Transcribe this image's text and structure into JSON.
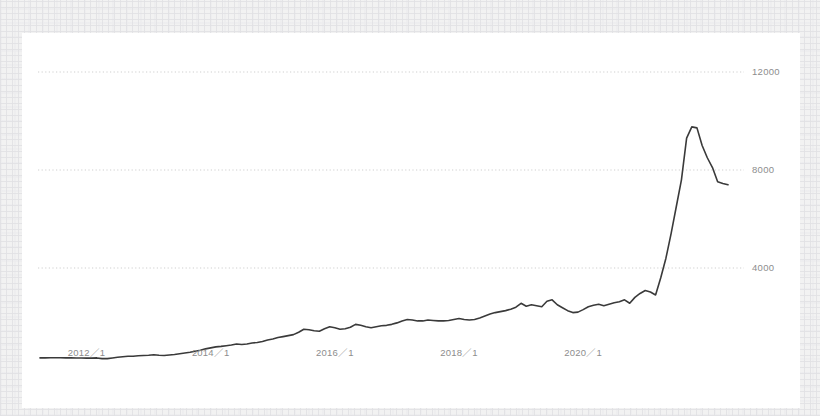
{
  "chart_data": {
    "type": "line",
    "title": "",
    "subtitle": "",
    "xlabel": "",
    "ylabel": "",
    "grid": true,
    "legend": null,
    "line_color": "#3a3a3a",
    "grid_color": "#c9c9c9",
    "tick_color": "#8d8d8d",
    "ylim": [
      0,
      13000
    ],
    "yticks": [
      4000,
      8000,
      12000
    ],
    "ytick_labels": [
      "4000",
      "8000",
      "12000"
    ],
    "xticks": [
      "2012/1",
      "2014/1",
      "2016/1",
      "2018/1",
      "2020/1"
    ],
    "xtick_labels": [
      "2012／1",
      "2014／1",
      "2016／1",
      "2018／1",
      "2020／1"
    ],
    "xlim": [
      "2011/4",
      "2021/8"
    ],
    "x": [
      "2011/4",
      "2011/5",
      "2011/6",
      "2011/7",
      "2011/8",
      "2011/9",
      "2011/10",
      "2011/11",
      "2011/12",
      "2012/1",
      "2012/2",
      "2012/3",
      "2012/4",
      "2012/5",
      "2012/6",
      "2012/7",
      "2012/8",
      "2012/9",
      "2012/10",
      "2012/11",
      "2012/12",
      "2013/1",
      "2013/2",
      "2013/3",
      "2013/4",
      "2013/5",
      "2013/6",
      "2013/7",
      "2013/8",
      "2013/9",
      "2013/10",
      "2013/11",
      "2013/12",
      "2014/1",
      "2014/2",
      "2014/3",
      "2014/4",
      "2014/5",
      "2014/6",
      "2014/7",
      "2014/8",
      "2014/9",
      "2014/10",
      "2014/11",
      "2014/12",
      "2015/1",
      "2015/2",
      "2015/3",
      "2015/4",
      "2015/5",
      "2015/6",
      "2015/7",
      "2015/8",
      "2015/9",
      "2015/10",
      "2015/11",
      "2015/12",
      "2016/1",
      "2016/2",
      "2016/3",
      "2016/4",
      "2016/5",
      "2016/6",
      "2016/7",
      "2016/8",
      "2016/9",
      "2016/10",
      "2016/11",
      "2016/12",
      "2017/1",
      "2017/2",
      "2017/3",
      "2017/4",
      "2017/5",
      "2017/6",
      "2017/7",
      "2017/8",
      "2017/9",
      "2017/10",
      "2017/11",
      "2017/12",
      "2018/1",
      "2018/2",
      "2018/3",
      "2018/4",
      "2018/5",
      "2018/6",
      "2018/7",
      "2018/8",
      "2018/9",
      "2018/10",
      "2018/11",
      "2018/12",
      "2019/1",
      "2019/2",
      "2019/3",
      "2019/4",
      "2019/5",
      "2019/6",
      "2019/7",
      "2019/8",
      "2019/9",
      "2019/10",
      "2019/11",
      "2019/12",
      "2020/1",
      "2020/2",
      "2020/3",
      "2020/4",
      "2020/5",
      "2020/6",
      "2020/7",
      "2020/8",
      "2020/9",
      "2020/10",
      "2020/11",
      "2020/12",
      "2021/1",
      "2021/2",
      "2021/3",
      "2021/4",
      "2021/5",
      "2021/6",
      "2021/7",
      "2021/8"
    ],
    "values": [
      330,
      330,
      335,
      335,
      335,
      330,
      330,
      325,
      325,
      320,
      320,
      330,
      300,
      300,
      330,
      360,
      380,
      400,
      400,
      420,
      430,
      440,
      460,
      440,
      430,
      450,
      470,
      500,
      530,
      560,
      600,
      640,
      700,
      740,
      780,
      800,
      830,
      860,
      900,
      880,
      900,
      940,
      960,
      1000,
      1060,
      1100,
      1160,
      1200,
      1240,
      1280,
      1380,
      1500,
      1480,
      1440,
      1420,
      1520,
      1600,
      1560,
      1500,
      1520,
      1580,
      1700,
      1660,
      1600,
      1560,
      1600,
      1640,
      1660,
      1700,
      1760,
      1840,
      1900,
      1880,
      1840,
      1840,
      1880,
      1860,
      1840,
      1840,
      1860,
      1900,
      1940,
      1900,
      1880,
      1900,
      1960,
      2040,
      2120,
      2180,
      2220,
      2260,
      2320,
      2400,
      2560,
      2440,
      2500,
      2460,
      2420,
      2640,
      2700,
      2500,
      2380,
      2260,
      2180,
      2200,
      2300,
      2420,
      2480,
      2520,
      2460,
      2520,
      2580,
      2620,
      2700,
      2560,
      2800,
      2960,
      3080,
      3020,
      2900,
      3600,
      4400,
      5400,
      6500,
      7600
    ],
    "values_tail": [
      9300,
      9760,
      9720,
      9000,
      8500,
      8100,
      7520,
      7450,
      7400
    ],
    "series_name": "value",
    "peak_value": 9760,
    "peak_x": "2021/5",
    "end_value": 7400,
    "start_value": 330
  },
  "card": {
    "background": "#ffffff"
  },
  "page": {
    "background": "#f2f2f2"
  }
}
